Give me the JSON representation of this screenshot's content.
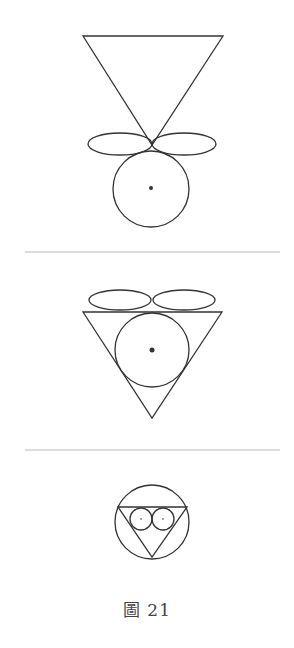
{
  "caption": "圖 21",
  "colors": {
    "stroke": "#333333",
    "separator": "#bbbbbb",
    "background": "#ffffff"
  },
  "figures": [
    {
      "name": "figure-1",
      "description": "Inverted triangle above two horizontal ellipses with a circle below",
      "triangle": {
        "points": [
          [
            83,
            36
          ],
          [
            223,
            36
          ],
          [
            152,
            145
          ]
        ]
      },
      "ellipses": [
        {
          "cx": 120,
          "cy": 144,
          "rx": 32,
          "ry": 11
        },
        {
          "cx": 184,
          "cy": 144,
          "rx": 32,
          "ry": 11
        }
      ],
      "circle": {
        "cx": 151,
        "cy": 189,
        "r": 38
      },
      "dot": {
        "cx": 151,
        "cy": 188,
        "r": 2
      }
    },
    {
      "name": "figure-2",
      "description": "Two ellipses on top of an inverted triangle with an inscribed circle",
      "triangle": {
        "points": [
          [
            83,
            312
          ],
          [
            222,
            312
          ],
          [
            152,
            418
          ]
        ]
      },
      "ellipses": [
        {
          "cx": 120,
          "cy": 300,
          "rx": 31,
          "ry": 10
        },
        {
          "cx": 184,
          "cy": 300,
          "rx": 31,
          "ry": 10
        }
      ],
      "circle": {
        "cx": 152,
        "cy": 350,
        "r": 37
      },
      "dot": {
        "cx": 152,
        "cy": 350,
        "r": 2.5
      }
    },
    {
      "name": "figure-3",
      "description": "Circle enclosing an inverted triangle containing two small circles",
      "circle": {
        "cx": 152,
        "cy": 522,
        "r": 37
      },
      "triangle": {
        "points": [
          [
            118,
            507
          ],
          [
            187,
            507
          ],
          [
            152,
            557
          ]
        ]
      },
      "small_circles": [
        {
          "cx": 141,
          "cy": 519,
          "r": 11
        },
        {
          "cx": 163,
          "cy": 519,
          "r": 11
        }
      ],
      "small_dots": [
        {
          "cx": 141,
          "cy": 519,
          "r": 0.8
        },
        {
          "cx": 163,
          "cy": 519,
          "r": 0.8
        }
      ]
    }
  ],
  "separators": [
    {
      "x1": 25,
      "x2": 280,
      "y": 252
    },
    {
      "x1": 25,
      "x2": 280,
      "y": 450
    }
  ]
}
